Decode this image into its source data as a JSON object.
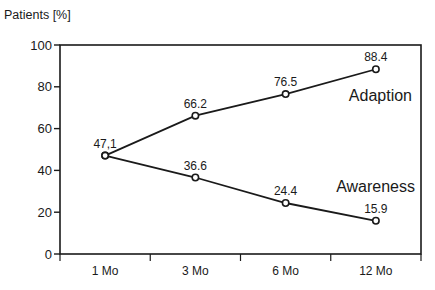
{
  "chart_data": {
    "type": "line",
    "title": "",
    "xlabel": "",
    "ylabel": "Patients [%]",
    "ylim": [
      0,
      100
    ],
    "yticks": [
      0,
      20,
      40,
      60,
      80,
      100
    ],
    "categories": [
      "1 Mo",
      "3 Mo",
      "6 Mo",
      "12 Mo"
    ],
    "grid": false,
    "legend": "inline labels at right",
    "series": [
      {
        "name": "Adaption",
        "values": [
          47.1,
          66.2,
          76.5,
          88.4
        ],
        "labels": [
          "47,1",
          "66.2",
          "76.5",
          "88.4"
        ]
      },
      {
        "name": "Awareness",
        "values": [
          47.1,
          36.6,
          24.4,
          15.9
        ],
        "labels": [
          "",
          "36.6",
          "24.4",
          "15.9"
        ]
      }
    ]
  }
}
